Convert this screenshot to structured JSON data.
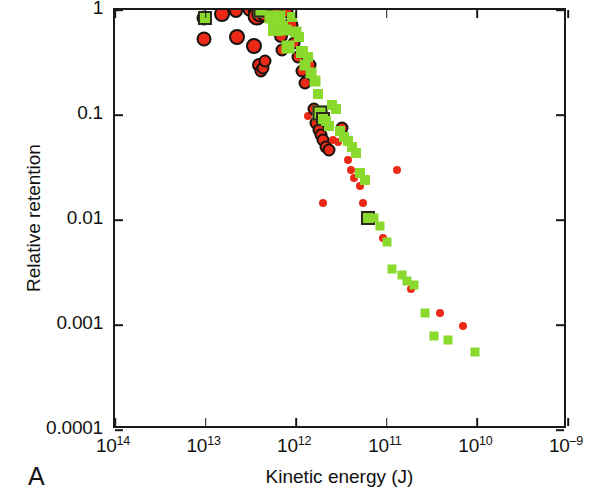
{
  "panel": {
    "label": "A"
  },
  "chart_data": {
    "type": "scatter",
    "title": "",
    "xlabel": "Kinetic energy (J)",
    "ylabel": "Relative retention",
    "xscale": "log",
    "yscale": "log",
    "x_axis_reversed": true,
    "grid": false,
    "legend": false,
    "xlim": [
      100000000000000.0,
      1000000000.0
    ],
    "ylim": [
      0.0001,
      1
    ],
    "xticks": [
      100000000000000.0,
      10000000000000.0,
      1000000000000.0,
      100000000000.0,
      10000000000.0,
      1000000000.0
    ],
    "xtick_labels": [
      "10¹⁴",
      "10¹³",
      "10¹²",
      "10¹¹",
      "10¹⁰",
      "10⁻⁹"
    ],
    "xtick_labels_parts": [
      {
        "mantissa": "10",
        "exponent": "14"
      },
      {
        "mantissa": "10",
        "exponent": "13"
      },
      {
        "mantissa": "10",
        "exponent": "12"
      },
      {
        "mantissa": "10",
        "exponent": "11"
      },
      {
        "mantissa": "10",
        "exponent": "10"
      },
      {
        "mantissa": "10",
        "exponent": "–9"
      }
    ],
    "yticks": [
      1,
      0.1,
      0.01,
      0.001,
      0.0001
    ],
    "ytick_labels": [
      "1",
      "0.1",
      "0.01",
      "0.001",
      "0.0001"
    ],
    "series": [
      {
        "name": "red-circles",
        "marker": "circle",
        "color": "#ea2a16",
        "edgecolor": "#17130f",
        "points": [
          {
            "x": 10500000000000.0,
            "y": 0.84,
            "size": 11,
            "outlined": true
          },
          {
            "x": 10500000000000.0,
            "y": 0.53,
            "size": 11,
            "outlined": true
          },
          {
            "x": 6600000000000.0,
            "y": 0.92,
            "size": 12,
            "outlined": true
          },
          {
            "x": 4600000000000.0,
            "y": 0.97,
            "size": 10,
            "outlined": true
          },
          {
            "x": 4500000000000.0,
            "y": 0.55,
            "size": 12,
            "outlined": true
          },
          {
            "x": 3300000000000.0,
            "y": 1.0,
            "size": 9,
            "outlined": true
          },
          {
            "x": 2850000000000.0,
            "y": 0.97,
            "size": 10,
            "outlined": true
          },
          {
            "x": 2700000000000.0,
            "y": 0.88,
            "size": 15,
            "outlined": true
          },
          {
            "x": 2500000000000.0,
            "y": 0.92,
            "size": 13,
            "outlined": true
          },
          {
            "x": 2350000000000.0,
            "y": 0.95,
            "size": 12,
            "outlined": true
          },
          {
            "x": 2200000000000.0,
            "y": 0.93,
            "size": 14,
            "outlined": true
          },
          {
            "x": 2050000000000.0,
            "y": 0.99,
            "size": 11,
            "outlined": true
          },
          {
            "x": 2900000000000.0,
            "y": 0.45,
            "size": 12,
            "outlined": true
          },
          {
            "x": 2600000000000.0,
            "y": 0.3,
            "size": 10,
            "outlined": true
          },
          {
            "x": 2450000000000.0,
            "y": 0.26,
            "size": 9,
            "outlined": true
          },
          {
            "x": 2300000000000.0,
            "y": 0.28,
            "size": 9,
            "outlined": true
          },
          {
            "x": 2200000000000.0,
            "y": 0.33,
            "size": 9,
            "outlined": true
          },
          {
            "x": 1750000000000.0,
            "y": 0.99,
            "size": 11,
            "outlined": true
          },
          {
            "x": 1600000000000.0,
            "y": 0.95,
            "size": 13,
            "outlined": true
          },
          {
            "x": 1480000000000.0,
            "y": 0.56,
            "size": 10,
            "outlined": true
          },
          {
            "x": 1420000000000.0,
            "y": 0.42,
            "size": 9,
            "outlined": true
          },
          {
            "x": 1250000000000.0,
            "y": 0.96,
            "size": 9,
            "outlined": true
          },
          {
            "x": 1150000000000.0,
            "y": 0.72,
            "size": 11,
            "outlined": true
          },
          {
            "x": 1050000000000.0,
            "y": 0.49,
            "size": 9,
            "outlined": true
          },
          {
            "x": 960000000000.0,
            "y": 0.36,
            "size": 9,
            "outlined": true
          },
          {
            "x": 860000000000.0,
            "y": 0.26,
            "size": 9,
            "outlined": true
          },
          {
            "x": 800000000000.0,
            "y": 0.2,
            "size": 9,
            "outlined": true
          },
          {
            "x": 740000000000.0,
            "y": 0.098,
            "size": 8,
            "outlined": false
          },
          {
            "x": 700000000000.0,
            "y": 0.3,
            "size": 9,
            "outlined": true
          },
          {
            "x": 640000000000.0,
            "y": 0.115,
            "size": 9,
            "outlined": true
          },
          {
            "x": 600000000000.0,
            "y": 0.083,
            "size": 9,
            "outlined": true
          },
          {
            "x": 560000000000.0,
            "y": 0.072,
            "size": 9,
            "outlined": true
          },
          {
            "x": 530000000000.0,
            "y": 0.064,
            "size": 9,
            "outlined": true
          },
          {
            "x": 500000000000.0,
            "y": 0.058,
            "size": 9,
            "outlined": true
          },
          {
            "x": 470000000000.0,
            "y": 0.05,
            "size": 9,
            "outlined": true
          },
          {
            "x": 440000000000.0,
            "y": 0.046,
            "size": 9,
            "outlined": true
          },
          {
            "x": 500000000000.0,
            "y": 0.0145,
            "size": 8,
            "outlined": false
          },
          {
            "x": 390000000000.0,
            "y": 0.058,
            "size": 8,
            "outlined": false
          },
          {
            "x": 350000000000.0,
            "y": 0.055,
            "size": 8,
            "outlined": false
          },
          {
            "x": 310000000000.0,
            "y": 0.075,
            "size": 9,
            "outlined": true
          },
          {
            "x": 270000000000.0,
            "y": 0.037,
            "size": 8,
            "outlined": false
          },
          {
            "x": 250000000000.0,
            "y": 0.03,
            "size": 8,
            "outlined": false
          },
          {
            "x": 230000000000.0,
            "y": 0.025,
            "size": 8,
            "outlined": false
          },
          {
            "x": 200000000000.0,
            "y": 0.021,
            "size": 8,
            "outlined": false
          },
          {
            "x": 185000000000.0,
            "y": 0.0145,
            "size": 8,
            "outlined": false
          },
          {
            "x": 155000000000.0,
            "y": 0.0105,
            "size": 8,
            "outlined": false
          },
          {
            "x": 110000000000.0,
            "y": 0.0068,
            "size": 8,
            "outlined": false
          },
          {
            "x": 78000000000.0,
            "y": 0.03,
            "size": 8,
            "outlined": false
          },
          {
            "x": 54000000000.0,
            "y": 0.0022,
            "size": 8,
            "outlined": false
          },
          {
            "x": 26000000000.0,
            "y": 0.0013,
            "size": 8,
            "outlined": false
          },
          {
            "x": 14500000000.0,
            "y": 0.00098,
            "size": 8,
            "outlined": false
          }
        ]
      },
      {
        "name": "green-squares",
        "marker": "square",
        "color": "#8ada2e",
        "edgecolor": "#2d2a1c",
        "points": [
          {
            "x": 10200000000000.0,
            "y": 0.84,
            "size": 10,
            "outlined": true
          },
          {
            "x": 2450000000000.0,
            "y": 1.0,
            "size": 11,
            "outlined": true
          },
          {
            "x": 1900000000000.0,
            "y": 0.86,
            "size": 13,
            "outlined": false
          },
          {
            "x": 1720000000000.0,
            "y": 0.66,
            "size": 14,
            "outlined": false
          },
          {
            "x": 1500000000000.0,
            "y": 0.88,
            "size": 11,
            "outlined": false
          },
          {
            "x": 1400000000000.0,
            "y": 0.71,
            "size": 10,
            "outlined": false
          },
          {
            "x": 1300000000000.0,
            "y": 0.64,
            "size": 11,
            "outlined": false
          },
          {
            "x": 1220000000000.0,
            "y": 0.44,
            "size": 13,
            "outlined": false
          },
          {
            "x": 1120000000000.0,
            "y": 0.86,
            "size": 10,
            "outlined": false
          },
          {
            "x": 1000000000000.0,
            "y": 0.62,
            "size": 11,
            "outlined": false
          },
          {
            "x": 920000000000.0,
            "y": 0.55,
            "size": 10,
            "outlined": false
          },
          {
            "x": 860000000000.0,
            "y": 0.4,
            "size": 12,
            "outlined": false
          },
          {
            "x": 800000000000.0,
            "y": 0.3,
            "size": 11,
            "outlined": false
          },
          {
            "x": 740000000000.0,
            "y": 0.36,
            "size": 10,
            "outlined": false
          },
          {
            "x": 680000000000.0,
            "y": 0.25,
            "size": 11,
            "outlined": false
          },
          {
            "x": 620000000000.0,
            "y": 0.21,
            "size": 11,
            "outlined": false
          },
          {
            "x": 580000000000.0,
            "y": 0.16,
            "size": 10,
            "outlined": false
          },
          {
            "x": 540000000000.0,
            "y": 0.105,
            "size": 11,
            "outlined": true
          },
          {
            "x": 500000000000.0,
            "y": 0.092,
            "size": 10,
            "outlined": true
          },
          {
            "x": 470000000000.0,
            "y": 0.088,
            "size": 10,
            "outlined": false
          },
          {
            "x": 430000000000.0,
            "y": 0.078,
            "size": 10,
            "outlined": false
          },
          {
            "x": 400000000000.0,
            "y": 0.125,
            "size": 10,
            "outlined": false
          },
          {
            "x": 360000000000.0,
            "y": 0.115,
            "size": 10,
            "outlined": false
          },
          {
            "x": 330000000000.0,
            "y": 0.07,
            "size": 10,
            "outlined": false
          },
          {
            "x": 300000000000.0,
            "y": 0.062,
            "size": 10,
            "outlined": false
          },
          {
            "x": 270000000000.0,
            "y": 0.056,
            "size": 10,
            "outlined": false
          },
          {
            "x": 245000000000.0,
            "y": 0.05,
            "size": 10,
            "outlined": false
          },
          {
            "x": 220000000000.0,
            "y": 0.043,
            "size": 10,
            "outlined": false
          },
          {
            "x": 200000000000.0,
            "y": 0.028,
            "size": 10,
            "outlined": false
          },
          {
            "x": 175000000000.0,
            "y": 0.024,
            "size": 10,
            "outlined": false
          },
          {
            "x": 160000000000.0,
            "y": 0.0105,
            "size": 10,
            "outlined": true
          },
          {
            "x": 140000000000.0,
            "y": 0.0105,
            "size": 9,
            "outlined": false
          },
          {
            "x": 120000000000.0,
            "y": 0.0088,
            "size": 9,
            "outlined": false
          },
          {
            "x": 100000000000.0,
            "y": 0.0062,
            "size": 9,
            "outlined": false
          },
          {
            "x": 88000000000.0,
            "y": 0.0034,
            "size": 9,
            "outlined": false
          },
          {
            "x": 68000000000.0,
            "y": 0.003,
            "size": 9,
            "outlined": false
          },
          {
            "x": 60000000000.0,
            "y": 0.0026,
            "size": 9,
            "outlined": false
          },
          {
            "x": 50000000000.0,
            "y": 0.0024,
            "size": 9,
            "outlined": false
          },
          {
            "x": 38000000000.0,
            "y": 0.0013,
            "size": 9,
            "outlined": false
          },
          {
            "x": 30000000000.0,
            "y": 0.00078,
            "size": 9,
            "outlined": false
          },
          {
            "x": 21000000000.0,
            "y": 0.00072,
            "size": 9,
            "outlined": false
          },
          {
            "x": 10500000000.0,
            "y": 0.00055,
            "size": 9,
            "outlined": false
          }
        ]
      }
    ]
  }
}
